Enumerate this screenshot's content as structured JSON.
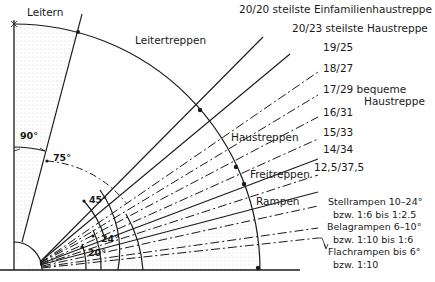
{
  "diagram": {
    "zones": {
      "ladders": "Leitern",
      "ladder_stairs": "Leitertreppen",
      "house_stairs": "Haustreppen",
      "outdoor_stairs": "Freitreppen",
      "ramps": "Rampen"
    },
    "stair_ratios": [
      {
        "ratio": "20/20",
        "note": "steilste Einfamilienhaustreppe",
        "style": "solid"
      },
      {
        "ratio": "20/23",
        "note": "steilste Haustreppe",
        "style": "solid"
      },
      {
        "ratio": "19/25",
        "note": "",
        "style": "dashdot"
      },
      {
        "ratio": "18/27",
        "note": "",
        "style": "dashdot"
      },
      {
        "ratio": "17/29",
        "note": "bequeme",
        "note2": "Haustreppe",
        "style": "solid"
      },
      {
        "ratio": "16/31",
        "note": "",
        "style": "dashdot"
      },
      {
        "ratio": "15/33",
        "note": "",
        "style": "solid"
      },
      {
        "ratio": "14/34",
        "note": "",
        "style": "dashdot"
      },
      {
        "ratio": "12,5/37,5",
        "note": "",
        "style": "solid"
      }
    ],
    "ramps": [
      {
        "line1": "Stellrampen 10–24°",
        "line2": "bzw. 1:6 bis 1:2.5"
      },
      {
        "line1": "Belagrampen 6–10°",
        "line2": "bzw. 1:10 bis 1:6"
      },
      {
        "line1": "Flachrampen bis 6°",
        "line2": "bzw. 1:10"
      }
    ],
    "angles": {
      "a90": "90°",
      "a75": "75°",
      "a45": "45°",
      "a24": "24°",
      "a20": "20°"
    }
  }
}
